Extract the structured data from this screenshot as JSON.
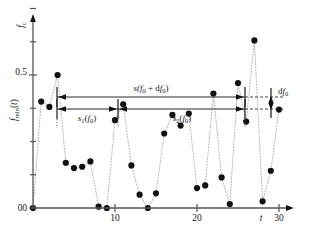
{
  "chart_data": {
    "type": "scatter",
    "title": "",
    "subtitle": "",
    "xlabel": "t",
    "ylabel": "f_min(t)",
    "y_axis_top_label": "f_c",
    "xlim": [
      0,
      31.5
    ],
    "ylim": [
      0,
      0.95
    ],
    "grid": false,
    "legend": "none",
    "x_ticks": [
      0,
      10,
      20,
      30
    ],
    "x_tick_labels": [
      "0",
      "10",
      "20",
      "30"
    ],
    "x_minor_ticks": [],
    "y_ticks": [
      0,
      0.5
    ],
    "y_tick_labels": [
      "0",
      "0.5"
    ],
    "y_minor_ticks": [
      0.125,
      0.25,
      0.375,
      0.625,
      0.75,
      0.875
    ],
    "connector_style": "dotted",
    "marker_style": "filled-circle",
    "x": [
      0,
      1,
      2,
      3,
      4,
      5,
      6,
      7,
      8,
      9,
      10,
      11,
      12,
      13,
      14,
      15,
      16,
      17,
      18,
      19,
      20,
      21,
      22,
      23,
      24,
      25,
      26,
      27,
      28,
      29,
      30
    ],
    "values": [
      0.0,
      0.4,
      0.38,
      0.5,
      0.17,
      0.15,
      0.155,
      0.175,
      0.005,
      0.0,
      0.33,
      0.39,
      0.16,
      0.05,
      0.0,
      0.055,
      0.28,
      0.35,
      0.31,
      0.355,
      0.075,
      0.085,
      0.43,
      0.115,
      0.015,
      0.47,
      0.325,
      0.63,
      0.025,
      0.14,
      0.37
    ],
    "annotations": [
      {
        "name": "span-top",
        "label": "s(f0 + df0)",
        "label_parts": [
          "s(",
          "f",
          "0",
          " + d",
          "f",
          "0",
          ")"
        ],
        "x_start": 3,
        "x_end": 26.2,
        "y": 0.41
      },
      {
        "name": "span-s1",
        "label": "s1(f0)",
        "label_parts": [
          "s",
          "1",
          "(",
          "f",
          "0",
          ")"
        ],
        "x_start": 3,
        "x_end": 11,
        "y": 0.355
      },
      {
        "name": "span-s2",
        "label": "s2(f0)",
        "label_parts": [
          "s",
          "2",
          "(",
          "f",
          "0",
          ")"
        ],
        "x_start": 11,
        "x_end": 26.2,
        "y": 0.355
      },
      {
        "name": "delta-df0",
        "label": "df0",
        "label_parts": [
          "d",
          "f",
          "0"
        ],
        "y_top": 0.41,
        "y_bottom": 0.355
      }
    ]
  },
  "labels": {
    "y_axis_name": "fmin(t)",
    "y_axis_name_parts": [
      "f",
      "min",
      "(",
      "t",
      ")"
    ],
    "y_axis_unit": "fc",
    "y_axis_unit_parts": [
      "f",
      "c"
    ],
    "x_axis_name": "t",
    "y_tick_0": "0",
    "y_tick_half": "0.5",
    "x_tick_0": "0",
    "x_tick_10": "10",
    "x_tick_20": "20",
    "x_tick_30": "30",
    "ann_top_s": "s(",
    "ann_top_f": "f",
    "ann_top_sub1": "0",
    "ann_top_plus": "+ d",
    "ann_top_f2": "f",
    "ann_top_sub2": "0",
    "ann_top_close": ")",
    "ann_s1_s": "s",
    "ann_s1_sub": "1",
    "ann_s1_open": "(",
    "ann_s1_f": "f",
    "ann_s1_fsub": "0",
    "ann_s1_close": ")",
    "ann_s2_s": "s",
    "ann_s2_sub": "2",
    "ann_s2_open": "(",
    "ann_s2_f": "f",
    "ann_s2_fsub": "0",
    "ann_s2_close": ")",
    "ann_df_d": "d",
    "ann_df_f": "f",
    "ann_df_sub": "0"
  },
  "colors": {
    "background": "#ffffff",
    "marker": "#111111",
    "connector": "#b8b8b8",
    "axis": "#555555",
    "annotation": "#1a1a1a"
  }
}
